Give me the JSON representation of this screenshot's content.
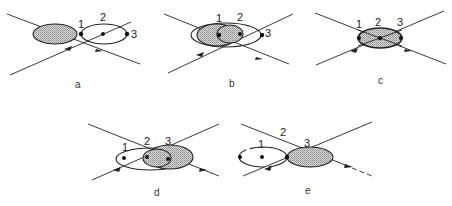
{
  "figure": {
    "panels": [
      {
        "id": "a",
        "label": "a",
        "points": [
          "1",
          "2",
          "3"
        ]
      },
      {
        "id": "b",
        "label": "b",
        "points": [
          "1",
          "2",
          "3"
        ]
      },
      {
        "id": "c",
        "label": "c",
        "points": [
          "1",
          "2",
          "3"
        ]
      },
      {
        "id": "d",
        "label": "d",
        "points": [
          "1",
          "2",
          "3"
        ]
      },
      {
        "id": "e",
        "label": "e",
        "points": [
          "1",
          "2",
          "3"
        ]
      }
    ]
  }
}
